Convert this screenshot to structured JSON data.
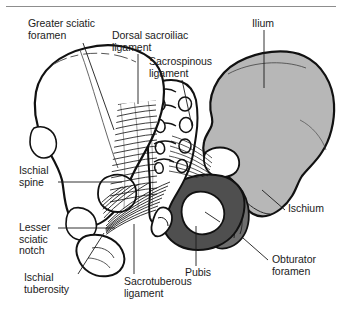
{
  "figure": {
    "type": "anatomical-illustration",
    "view": "posterior",
    "style": "black-and-white line drawing with gray tonal fills"
  },
  "colors": {
    "background": "#ffffff",
    "outline": "#111111",
    "rule": "#8d8d8d",
    "text": "#1b1b1b",
    "ilium_fill": "#b7b7b7",
    "ilium_fill_light": "#c8c8c8",
    "pubis_fill": "#4f4f4f",
    "ischium_fill": "#6e6e6e",
    "sacrum_fill": "#ffffff",
    "leader_line": "#1b1b1b"
  },
  "labels": [
    {
      "id": "greater-sciatic-foramen",
      "lines": [
        "Greater sciatic",
        "foramen"
      ],
      "text": "Greater sciatic foramen",
      "x": 28,
      "y": 18,
      "align": "left",
      "leader": {
        "x1": 83,
        "y1": 43,
        "x2": 114,
        "y2": 130
      }
    },
    {
      "id": "dorsal-sacroiliac-ligament",
      "lines": [
        "Dorsal sacroiliac",
        "ligament"
      ],
      "text": "Dorsal sacroiliac ligament",
      "x": 112,
      "y": 30,
      "align": "left",
      "leader": {
        "x1": 138,
        "y1": 54,
        "x2": 138,
        "y2": 104
      }
    },
    {
      "id": "sacrospinous-ligament",
      "lines": [
        "Sacrospinous",
        "ligament"
      ],
      "text": "Sacrospinous ligament",
      "x": 149,
      "y": 56,
      "align": "left",
      "leader": {
        "x1": 182,
        "y1": 80,
        "x2": 192,
        "y2": 126
      }
    },
    {
      "id": "ilium",
      "lines": [
        "Ilium"
      ],
      "text": "Ilium",
      "x": 252,
      "y": 18,
      "align": "left",
      "leader": {
        "x1": 264,
        "y1": 30,
        "x2": 264,
        "y2": 88
      }
    },
    {
      "id": "ischial-spine",
      "lines": [
        "Ischial",
        "spine"
      ],
      "text": "Ischial spine",
      "x": 19,
      "y": 165,
      "align": "left",
      "leader": {
        "x1": 58,
        "y1": 182,
        "x2": 122,
        "y2": 182
      }
    },
    {
      "id": "lesser-sciatic-notch",
      "lines": [
        "Lesser",
        "sciatic",
        "notch"
      ],
      "text": "Lesser sciatic notch",
      "x": 19,
      "y": 222,
      "align": "left",
      "leader": {
        "x1": 58,
        "y1": 228,
        "x2": 115,
        "y2": 228
      }
    },
    {
      "id": "ischial-tuberosity",
      "lines": [
        "Ischial",
        "tuberosity"
      ],
      "text": "Ischial tuberosity",
      "x": 24,
      "y": 275,
      "align": "left",
      "leader": {
        "x1": 78,
        "y1": 274,
        "x2": 104,
        "y2": 233
      }
    },
    {
      "id": "sacrotuberous-ligament",
      "lines": [
        "Sacrotuberous",
        "ligament"
      ],
      "text": "Sacrotuberous ligament",
      "x": 124,
      "y": 278,
      "align": "left",
      "leader": {
        "x1": 134,
        "y1": 274,
        "x2": 134,
        "y2": 224
      }
    },
    {
      "id": "pubis",
      "lines": [
        "Pubis"
      ],
      "text": "Pubis",
      "x": 185,
      "y": 269,
      "align": "left",
      "leader": {
        "x1": 196,
        "y1": 266,
        "x2": 196,
        "y2": 226
      }
    },
    {
      "id": "ischium",
      "lines": [
        "Ischium"
      ],
      "text": "Ischium",
      "x": 288,
      "y": 208,
      "align": "left",
      "leader": {
        "x1": 285,
        "y1": 210,
        "x2": 262,
        "y2": 190
      }
    },
    {
      "id": "obturator-foramen",
      "lines": [
        "Obturator",
        "foramen"
      ],
      "text": "Obturator foramen",
      "x": 272,
      "y": 258,
      "align": "left",
      "leader": {
        "x1": 268,
        "y1": 260,
        "x2": 243,
        "y2": 238
      }
    }
  ],
  "structures": [
    {
      "id": "ilium-left",
      "name": "Left ilium (near side, unshaded)"
    },
    {
      "id": "ilium-right",
      "name": "Right ilium (shaded gray)"
    },
    {
      "id": "sacrum",
      "name": "Sacrum with dorsal sacral foramina"
    },
    {
      "id": "coccyx",
      "name": "Coccyx"
    },
    {
      "id": "pubis",
      "name": "Pubis (dark fill)"
    },
    {
      "id": "ischium",
      "name": "Ischium (mid gray fill)"
    },
    {
      "id": "obturator-foramen",
      "name": "Obturator foramen (white opening)"
    },
    {
      "id": "dorsal-sacroiliac-ligament",
      "name": "Dorsal sacroiliac ligament fibers"
    },
    {
      "id": "sacrospinous-ligament",
      "name": "Sacrospinous ligament fibers"
    },
    {
      "id": "sacrotuberous-ligament",
      "name": "Sacrotuberous ligament fibers"
    }
  ]
}
